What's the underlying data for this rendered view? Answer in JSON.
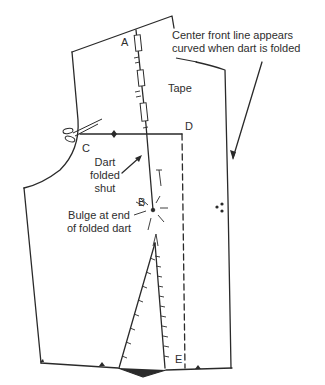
{
  "diagram": {
    "type": "sewing pattern - bodice front with dart folded shut",
    "colors": {
      "ink": "#2a2a2a",
      "background": "#ffffff"
    },
    "points": {
      "A": "A",
      "B": "B",
      "C": "C",
      "D": "D",
      "E": "E"
    },
    "labels": {
      "tape": "Tape",
      "dart_line1": "Dart",
      "dart_line2": "folded",
      "dart_line3": "shut",
      "bulge_line1": "Bulge at end",
      "bulge_line2": "of folded dart",
      "center_front_line1": "Center front line appears",
      "center_front_line2": "curved when dart is folded"
    },
    "icons": [
      "scissors-icon",
      "notch-diamond-icon",
      "dot-cluster-icon"
    ]
  }
}
